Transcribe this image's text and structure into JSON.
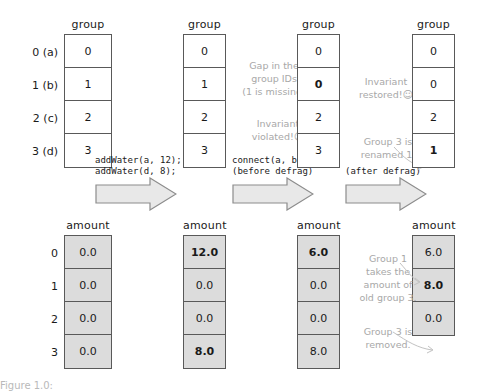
{
  "diagram": {
    "title_caption": "Figure 1.0:",
    "tables": [
      {
        "id": "state-0",
        "group": {
          "header": "group",
          "row_labels": [
            "0 (a)",
            "1 (b)",
            "2 (c)",
            "3 (d)"
          ],
          "values": [
            "0",
            "1",
            "2",
            "3"
          ],
          "bold": [
            false,
            false,
            false,
            false
          ]
        },
        "amount": {
          "header": "amount",
          "row_labels": [
            "0",
            "1",
            "2",
            "3"
          ],
          "values": [
            "0.0",
            "0.0",
            "0.0",
            "0.0"
          ],
          "bold": [
            false,
            false,
            false,
            false
          ]
        }
      },
      {
        "id": "state-1",
        "group": {
          "header": "group",
          "row_labels": [],
          "values": [
            "0",
            "1",
            "2",
            "3"
          ],
          "bold": [
            false,
            false,
            false,
            false
          ]
        },
        "amount": {
          "header": "amount",
          "row_labels": [],
          "values": [
            "12.0",
            "0.0",
            "0.0",
            "8.0"
          ],
          "bold": [
            true,
            false,
            false,
            true
          ]
        }
      },
      {
        "id": "state-2",
        "group": {
          "header": "group",
          "row_labels": [],
          "values": [
            "0",
            "0",
            "2",
            "3"
          ],
          "bold": [
            false,
            true,
            false,
            false
          ]
        },
        "amount": {
          "header": "amount",
          "row_labels": [],
          "values": [
            "6.0",
            "0.0",
            "0.0",
            "8.0"
          ],
          "bold": [
            true,
            false,
            false,
            false
          ]
        }
      },
      {
        "id": "state-3",
        "group": {
          "header": "group",
          "row_labels": [],
          "values": [
            "0",
            "0",
            "2",
            "1"
          ],
          "bold": [
            false,
            false,
            false,
            true
          ]
        },
        "amount": {
          "header": "amount",
          "row_labels": [],
          "values": [
            "6.0",
            "8.0",
            "0.0"
          ],
          "bold": [
            false,
            true,
            false
          ]
        }
      }
    ],
    "arrows": [
      {
        "id": "arrow-1",
        "lines": "addWater(a, 12);\naddWater(d, 8);"
      },
      {
        "id": "arrow-2",
        "lines": "connect(a, b);\n(before defrag)"
      },
      {
        "id": "arrow-3",
        "lines": "(after defrag)"
      }
    ],
    "annotations": [
      {
        "id": "gap-note",
        "text": "Gap in the\ngroup IDs\n(1 is missing)"
      },
      {
        "id": "invariant-violated-note",
        "text": "Invariant\nviolated!",
        "emoji": "☹"
      },
      {
        "id": "invariant-restored-note",
        "text": "Invariant\nrestored!",
        "emoji": "☺"
      },
      {
        "id": "rename-note",
        "text": "Group 3 is\nrenamed 1."
      },
      {
        "id": "takes-amount-note",
        "text": "Group 1\ntakes the\namount of\nold group 3."
      },
      {
        "id": "removed-note",
        "text": "Group 3 is\nremoved."
      }
    ],
    "colors": {
      "border": "#595959",
      "shaded_cell": "#dcdcdc",
      "annotation_text": "#a8a8a8",
      "text": "#1a1a1a",
      "arrow_fill": "#e8e8e8"
    }
  }
}
